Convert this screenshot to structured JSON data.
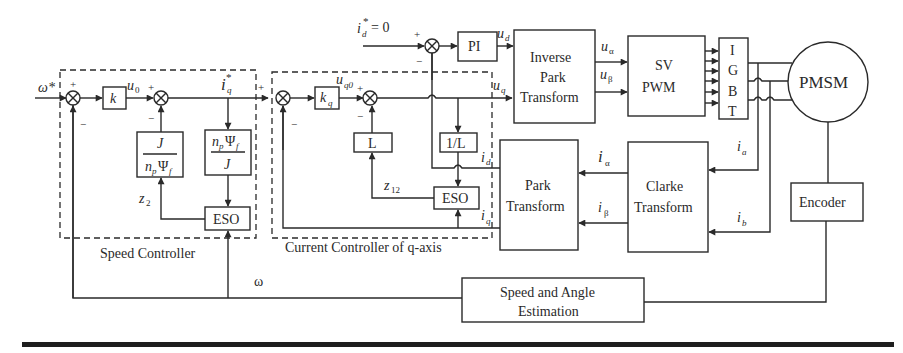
{
  "diagram": {
    "groups": {
      "speed_controller": "Speed Controller",
      "current_controller": "Current Controller of q-axis"
    },
    "blocks": {
      "k": "k",
      "kq": "k",
      "kq_sub": "q",
      "j_over_np_psi_num": "J",
      "j_over_np_psi_den": "n",
      "j_over_np_psi_den_sub": "p",
      "j_over_np_psi_den_rest": "Ψ",
      "j_over_np_psi_den_sub2": "f",
      "np_psi_over_j_num": "n",
      "np_psi_over_j_num_sub": "p",
      "np_psi_over_j_num_rest": "Ψ",
      "np_psi_over_j_num_sub2": "f",
      "np_psi_over_j_den": "J",
      "eso_speed": "ESO",
      "eso_current": "ESO",
      "L": "L",
      "one_over_L": "1/L",
      "pi": "PI",
      "inverse_park": [
        "Inverse",
        "Park",
        "Transform"
      ],
      "svpwm": [
        "SV",
        "PWM"
      ],
      "igbt": [
        "I",
        "G",
        "B",
        "T"
      ],
      "pmsm": "PMSM",
      "park": [
        "Park",
        "Transform"
      ],
      "clarke": [
        "Clarke",
        "Transform"
      ],
      "encoder": "Encoder",
      "speed_angle": [
        "Speed and Angle",
        "Estimation"
      ]
    },
    "signals": {
      "omega_ref": "ω*",
      "u0": "u",
      "u0_sub": "0",
      "iq_ref": "i",
      "iq_ref_sub": "q",
      "iq_ref_sup": "*",
      "uq0": "u",
      "uq0_sub": "q0",
      "id_ref": "i",
      "id_ref_sub": "d",
      "id_ref_sup": "*",
      "id_ref_val": "= 0",
      "ud": "u",
      "ud_sub": "d",
      "uq": "u",
      "uq_sub": "q",
      "ualpha": "u",
      "ualpha_sub": "α",
      "ubeta": "u",
      "ubeta_sub": "β",
      "ialpha": "i",
      "ialpha_sub": "α",
      "ibeta": "i",
      "ibeta_sub": "β",
      "ia": "i",
      "ia_sub": "a",
      "ib": "i",
      "ib_sub": "b",
      "id": "i",
      "id_sub": "d",
      "iq": "i",
      "iq_sub": "q",
      "z2": "z",
      "z2_sub": "2",
      "z12": "z",
      "z12_sub": "12",
      "omega": "ω",
      "plus": "+",
      "minus": "−"
    }
  }
}
